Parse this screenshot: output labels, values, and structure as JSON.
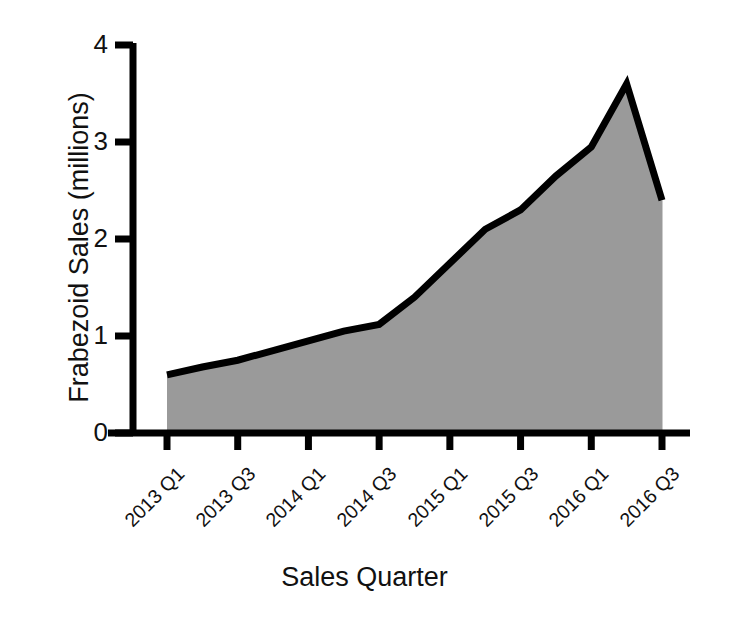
{
  "chart_data": {
    "type": "area",
    "title": "",
    "xlabel": "Sales Quarter",
    "ylabel": "Frabezoid Sales (millions)",
    "ylim": [
      0,
      4
    ],
    "y_ticks": [
      "0",
      "1",
      "2",
      "3",
      "4"
    ],
    "y_tick_values": [
      0,
      1,
      2,
      3,
      4
    ],
    "grid": false,
    "legend": "none",
    "line_color": "#000000",
    "fill_color": "#9a9a9a",
    "axis_color": "#000000",
    "categories": [
      "2013 Q1",
      "2013 Q2",
      "2013 Q3",
      "2013 Q4",
      "2014 Q1",
      "2014 Q2",
      "2014 Q3",
      "2014 Q4",
      "2015 Q1",
      "2015 Q2",
      "2015 Q3",
      "2015 Q4",
      "2016 Q1",
      "2016 Q2",
      "2016 Q3"
    ],
    "values": [
      0.6,
      0.68,
      0.75,
      0.85,
      0.95,
      1.05,
      1.12,
      1.4,
      1.75,
      2.1,
      2.3,
      2.65,
      2.95,
      3.6,
      2.4
    ],
    "x_tick_labels": [
      "2013 Q1",
      "2013 Q3",
      "2014 Q1",
      "2014 Q3",
      "2015 Q1",
      "2015 Q3",
      "2016 Q1",
      "2016 Q3"
    ],
    "x_tick_indices": [
      0,
      2,
      4,
      6,
      8,
      10,
      12,
      14
    ]
  }
}
